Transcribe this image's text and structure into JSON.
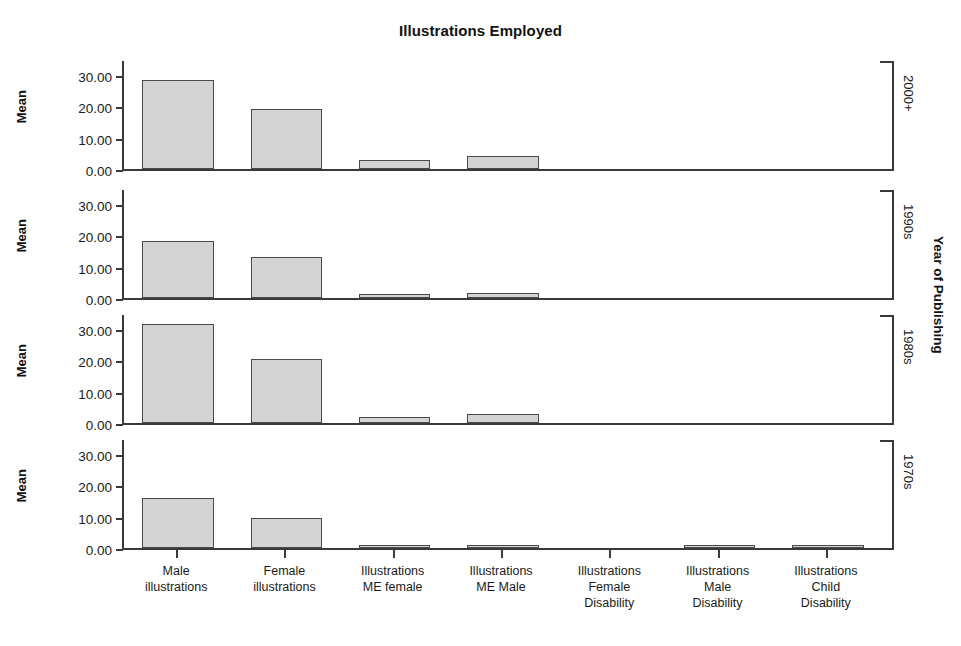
{
  "chart_data": {
    "type": "bar",
    "title": "Illustrations Employed",
    "xlabel": "",
    "ylabel": "Mean",
    "strip_axis_title": "Year of Publishing",
    "grid": false,
    "legend": "none",
    "ylim": [
      0,
      35
    ],
    "ytick_labels": [
      "0.00",
      "10.00",
      "20.00",
      "30.00"
    ],
    "ytick_values": [
      0,
      10,
      20,
      30
    ],
    "categories": [
      "Male illustrations",
      "Female illustrations",
      "Illustrations ME female",
      "Illustrations ME Male",
      "Illustrations Female Disability",
      "Illustrations Male Disability",
      "Illustrations Child Disability"
    ],
    "category_lines": [
      [
        "Male",
        "illustrations"
      ],
      [
        "Female",
        "illustrations"
      ],
      [
        "Illustrations",
        "ME female"
      ],
      [
        "Illustrations",
        "ME Male"
      ],
      [
        "Illustrations",
        "Female",
        "Disability"
      ],
      [
        "Illustrations",
        "Male",
        "Disability"
      ],
      [
        "Illustrations",
        "Child",
        "Disability"
      ]
    ],
    "panel_variable": "Year of Publishing",
    "panels": [
      {
        "label": "2000+",
        "values": [
          28.4,
          19.0,
          3.0,
          4.0,
          0.0,
          0.0,
          0.0
        ]
      },
      {
        "label": "1990s",
        "values": [
          18.0,
          13.0,
          1.3,
          1.5,
          0.0,
          0.0,
          0.0
        ]
      },
      {
        "label": "1980s",
        "values": [
          31.5,
          20.3,
          1.8,
          3.0,
          0.0,
          0.0,
          0.0
        ]
      },
      {
        "label": "1970s",
        "values": [
          16.0,
          9.7,
          0.3,
          1.0,
          0.0,
          1.0,
          0.9
        ]
      }
    ],
    "colors": {
      "bar_fill": "#d4d4d4",
      "bar_edge": "#4a4a4a",
      "axis": "#3a3a3a",
      "text": "#1a1a1a",
      "background": "#ffffff"
    }
  }
}
